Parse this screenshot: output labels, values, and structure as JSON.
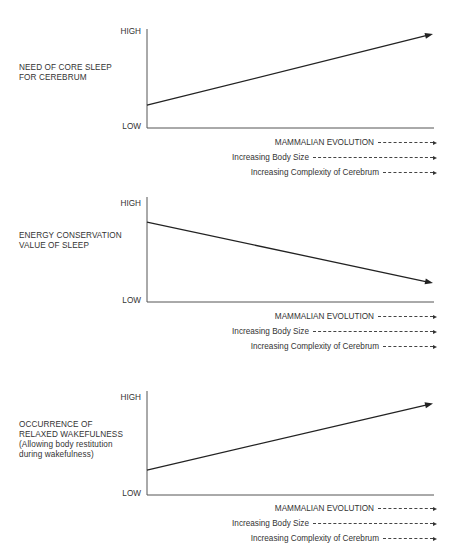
{
  "figure": {
    "y_tick_high": "HIGH",
    "y_tick_low": "LOW",
    "legend": [
      {
        "label": "MAMMALIAN EVOLUTION",
        "style": "dashed-arrow"
      },
      {
        "label": "Increasing Body Size",
        "style": "dashed-arrow"
      },
      {
        "label": "Increasing Complexity of Cerebrum",
        "style": "dashed-arrow"
      }
    ]
  },
  "chart_data": [
    {
      "type": "line",
      "title": "",
      "ylabel_lines": [
        "NEED OF CORE SLEEP",
        "FOR CEREBRUM"
      ],
      "xlabel": "MAMMALIAN EVOLUTION",
      "y_ticks": [
        "LOW",
        "HIGH"
      ],
      "ylim": [
        0,
        1
      ],
      "xlim": [
        0,
        1
      ],
      "x": [
        0,
        1
      ],
      "values": [
        0.23,
        0.95
      ],
      "trend": "increasing",
      "end_marker": "arrow",
      "grid": false
    },
    {
      "type": "line",
      "title": "",
      "ylabel_lines": [
        "ENERGY CONSERVATION",
        "VALUE OF SLEEP"
      ],
      "xlabel": "MAMMALIAN EVOLUTION",
      "y_ticks": [
        "LOW",
        "HIGH"
      ],
      "ylim": [
        0,
        1
      ],
      "xlim": [
        0,
        1
      ],
      "x": [
        0,
        1
      ],
      "values": [
        0.76,
        0.18
      ],
      "trend": "decreasing",
      "end_marker": "arrow",
      "grid": false
    },
    {
      "type": "line",
      "title": "",
      "ylabel_lines": [
        "OCCURRENCE OF",
        "RELAXED WAKEFULNESS",
        "(Allowing body restitution",
        "during wakefulness)"
      ],
      "xlabel": "MAMMALIAN EVOLUTION",
      "y_ticks": [
        "LOW",
        "HIGH"
      ],
      "ylim": [
        0,
        1
      ],
      "xlim": [
        0,
        1
      ],
      "x": [
        0,
        1
      ],
      "values": [
        0.24,
        0.88
      ],
      "trend": "increasing",
      "end_marker": "arrow",
      "grid": false
    }
  ]
}
